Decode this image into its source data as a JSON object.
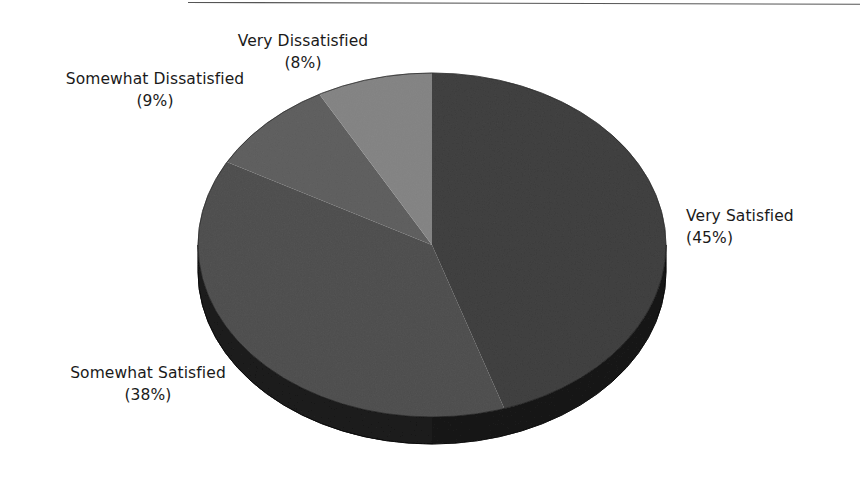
{
  "page": {
    "background_color": "#ffffff",
    "width": 860,
    "height": 480
  },
  "divider": {
    "name": "top-horizontal-rule",
    "color": "#555555"
  },
  "chart_data": {
    "type": "pie",
    "title": "",
    "subtitle": "",
    "xlabel": "",
    "ylabel": "",
    "legend_position": "none",
    "grid": false,
    "style": "3d-pie",
    "start_angle_deg": 0,
    "direction": "clockwise",
    "categories": [
      "Very Satisfied",
      "Somewhat Satisfied",
      "Somewhat Dissatisfied",
      "Very Dissatisfied"
    ],
    "values": [
      45,
      38,
      9,
      8
    ],
    "value_unit": "%",
    "slices": [
      {
        "label": "Very Satisfied",
        "percent": 45,
        "percent_text": "(45%)",
        "color": "#808080",
        "side_color": "#4c4c4c",
        "label_position": "right"
      },
      {
        "label": "Somewhat Satisfied",
        "percent": 38,
        "percent_text": "(38%)",
        "color": "#8f8f8f",
        "side_color": "#555555",
        "label_position": "bottom-left"
      },
      {
        "label": "Somewhat Dissatisfied",
        "percent": 9,
        "percent_text": "(9%)",
        "color": "#9c9c9c",
        "side_color": "#5e5e5e",
        "label_position": "top-left"
      },
      {
        "label": "Very Dissatisfied",
        "percent": 8,
        "percent_text": "(8%)",
        "color": "#b8b8b8",
        "side_color": "#6e6e6e",
        "label_position": "top-center"
      }
    ],
    "annotations": [
      "Very Dissatisfied (8%)",
      "Somewhat Dissatisfied (9%)",
      "Somewhat Satisfied (38%)",
      "Very Satisfied (45%)"
    ]
  },
  "labels": {
    "very_dissatisfied": {
      "name": "Very Dissatisfied",
      "percent": "(8%)"
    },
    "somewhat_dissatisfied": {
      "name": "Somewhat Dissatisfied",
      "percent": "(9%)"
    },
    "somewhat_satisfied": {
      "name": "Somewhat Satisfied",
      "percent": "(38%)"
    },
    "very_satisfied": {
      "name": "Very Satisfied",
      "percent": "(45%)"
    }
  }
}
